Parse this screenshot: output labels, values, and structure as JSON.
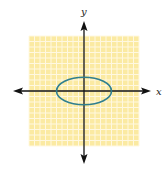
{
  "chart_data": {
    "type": "line",
    "title": "",
    "xlabel": "x",
    "ylabel": "y",
    "xlim": [
      -10,
      10
    ],
    "ylim": [
      -10,
      10
    ],
    "grid": true,
    "legend": null,
    "series": [
      {
        "name": "ellipse",
        "shape": "ellipse",
        "center": [
          0,
          0
        ],
        "semi_major_x": 5,
        "semi_minor_y": 2.5,
        "color": "#2f7f8f"
      }
    ]
  },
  "style": {
    "grid_background": "#fbeaa2",
    "grid_line_color": "#fff8e0",
    "axis_color": "#111111",
    "curve_color": "#2f7f8f"
  },
  "labels": {
    "x_axis": "x",
    "y_axis": "y"
  }
}
